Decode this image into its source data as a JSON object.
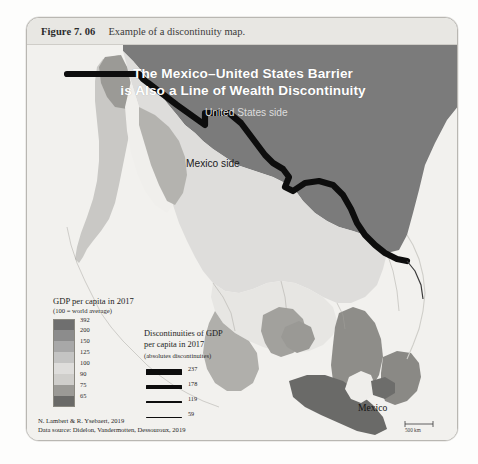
{
  "figure": {
    "number_label": "Figure 7. 06",
    "caption": "Example of a discontinuity map."
  },
  "map": {
    "title_line1": "The Mexico–United States Barrier",
    "title_line2": "is Also a Line of Wealth Discontinuity",
    "label_us_side": "United States side",
    "label_mx_side": "Mexico side",
    "label_mexico_city": "Mexico",
    "scalebar": "500 km"
  },
  "legend_gdp": {
    "title": "GDP per capita in 2017",
    "subtitle": "(100 = world average)",
    "classes": [
      {
        "value": "392",
        "color": "#6f6f6f"
      },
      {
        "value": "200",
        "color": "#8c8c8c"
      },
      {
        "value": "150",
        "color": "#a8a8a8"
      },
      {
        "value": "125",
        "color": "#c4c4c3"
      },
      {
        "value": "100",
        "color": "#dedddb"
      },
      {
        "value": "90",
        "color": "#cfcecb"
      },
      {
        "value": "75",
        "color": "#9b9a96"
      },
      {
        "value": "65",
        "color": "#6a6a68"
      }
    ]
  },
  "legend_disc": {
    "title_line1": "Discontinuities of GDP",
    "title_line2": "per capita in 2017",
    "subtitle": "(absolutes discontinuites)",
    "items": [
      {
        "value": "237",
        "thickness": 6.5
      },
      {
        "value": "178",
        "thickness": 4.0
      },
      {
        "value": "119",
        "thickness": 1.8
      },
      {
        "value": "59",
        "thickness": 0.8
      }
    ]
  },
  "credits": {
    "line1": "N. Lambert & R. Ysebaert, 2019",
    "line2": "Data source: Didelon, Vandermotten, Dessouroux, 2019"
  },
  "colors": {
    "us_fill": "#7b7b7b",
    "sea": "#f2f1ee",
    "barrier": "#0d0d0d"
  }
}
